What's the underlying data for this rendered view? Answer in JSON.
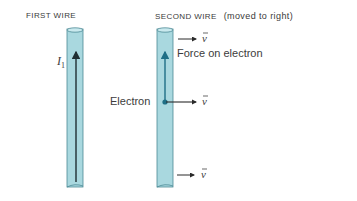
{
  "labels": {
    "first_wire": "FIRST WIRE",
    "second_wire": "SECOND WIRE",
    "second_wire_note": "(moved to right)",
    "current": "I",
    "current_sub": "1",
    "force": "Force on electron",
    "electron": "Electron",
    "velocity": "v"
  },
  "colors": {
    "wire_fill": "#a9d8df",
    "wire_edge": "#4d8a95",
    "arrow_dark": "#1f2f33",
    "arrow_blue": "#1f6f86",
    "text": "#3a3a3a"
  }
}
